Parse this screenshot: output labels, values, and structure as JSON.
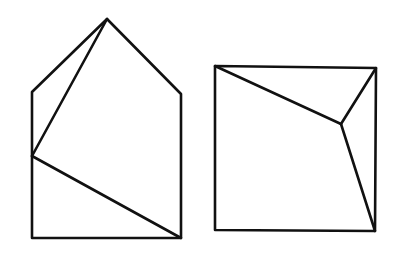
{
  "canvas": {
    "width": 396,
    "height": 261,
    "background": "#ffffff",
    "stroke_color": "#111111",
    "stroke_width": 2.6
  },
  "figures": [
    {
      "name": "pentagon-house",
      "outline": [
        [
          32,
          92
        ],
        [
          107,
          19
        ],
        [
          181,
          94
        ],
        [
          181,
          238
        ],
        [
          32,
          238
        ]
      ],
      "segments": [
        [
          [
            107,
            19
          ],
          [
            32,
            156
          ]
        ],
        [
          [
            32,
            156
          ],
          [
            181,
            238
          ]
        ]
      ]
    },
    {
      "name": "square",
      "outline": [
        [
          215,
          66
        ],
        [
          376,
          68
        ],
        [
          375,
          231
        ],
        [
          215,
          230
        ]
      ],
      "segments": [
        [
          [
            215,
            66
          ],
          [
            341,
            124
          ]
        ],
        [
          [
            341,
            124
          ],
          [
            376,
            68
          ]
        ],
        [
          [
            341,
            124
          ],
          [
            375,
            231
          ]
        ]
      ]
    }
  ]
}
